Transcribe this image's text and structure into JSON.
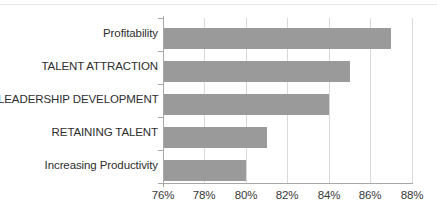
{
  "chart_data": {
    "type": "bar",
    "orientation": "horizontal",
    "title": "",
    "subtitle": "",
    "xlabel": "",
    "ylabel": "",
    "categories": [
      "Profitability",
      "TALENT ATTRACTION",
      "LEADERSHIP DEVELOPMENT",
      "RETAINING TALENT",
      "Increasing Productivity"
    ],
    "values": [
      87,
      85,
      84,
      81,
      80
    ],
    "value_suffix": "%",
    "xlim": [
      76,
      88
    ],
    "xticks": [
      76,
      78,
      80,
      82,
      84,
      86,
      88
    ],
    "xtick_labels": [
      "76%",
      "78%",
      "80%",
      "82%",
      "84%",
      "86%",
      "88%"
    ],
    "grid": true,
    "grid_axis": "x",
    "legend": false,
    "legend_position": "none",
    "bar_color": "#9a9a9a",
    "gridline_color": "#d9d9d9",
    "axis_color": "#a8a8a8",
    "text_color": "#2e2e2e",
    "background_color": "#ffffff"
  }
}
